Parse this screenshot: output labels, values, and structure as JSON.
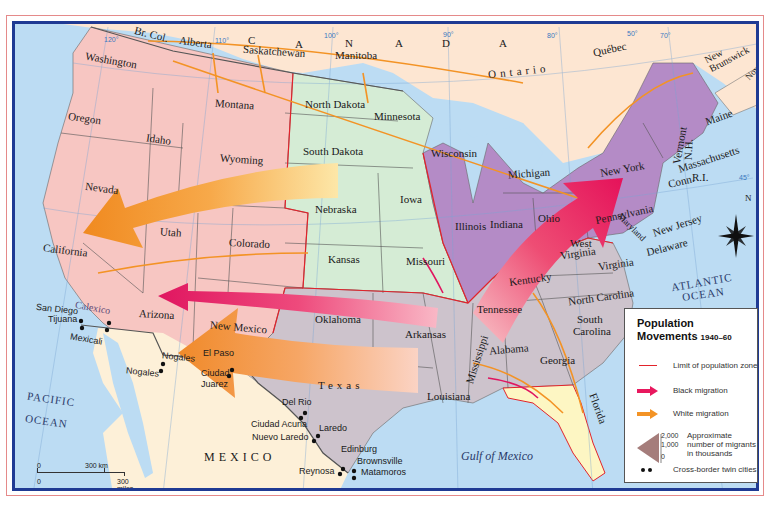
{
  "title": "Population Movements 1940–60",
  "colors": {
    "ocean": "#bcdcf3",
    "canada": "#fde6d2",
    "mexico": "#fdf0d8",
    "west_zone": "#f7c6c2",
    "plains_zone": "#d5ecd5",
    "northeast_midwest_zone": "#b48bc6",
    "south_zone": "#cdc3cc",
    "florida": "#fdf6c3",
    "black_migration": "#e8185e",
    "white_migration": "#f39325",
    "zone_limit": "#e2232b",
    "frame": "#1f3a93"
  },
  "countries": {
    "canada_letters": [
      "C",
      "A",
      "N",
      "A",
      "D",
      "A"
    ],
    "mexico": "MEXICO"
  },
  "provinces": [
    "Br. Col.",
    "Alberta",
    "Saskatchewan",
    "Manitoba",
    "Ontario",
    "Québec",
    "New Brunswick",
    "Nova Scotia"
  ],
  "states": {
    "washington": "Washington",
    "oregon": "Oregon",
    "california": "California",
    "idaho": "Idaho",
    "nevada": "Nevada",
    "montana": "Montana",
    "wyoming": "Wyoming",
    "utah": "Utah",
    "colorado": "Colorado",
    "arizona": "Arizona",
    "new_mexico": "New Mexico",
    "north_dakota": "North Dakota",
    "south_dakota": "South Dakota",
    "nebraska": "Nebraska",
    "kansas": "Kansas",
    "minnesota": "Minnesota",
    "iowa": "Iowa",
    "missouri": "Missouri",
    "oklahoma": "Oklahoma",
    "texas": "Texas",
    "arkansas": "Arkansas",
    "louisiana": "Louisiana",
    "wisconsin": "Wisconsin",
    "michigan": "Michigan",
    "illinois": "Illinois",
    "indiana": "Indiana",
    "ohio": "Ohio",
    "kentucky": "Kentucky",
    "tennessee": "Tennessee",
    "mississippi": "Mississippi",
    "alabama": "Alabama",
    "georgia": "Georgia",
    "florida": "Florida",
    "south_carolina_1": "South",
    "south_carolina_2": "Carolina",
    "north_carolina": "North Carolina",
    "virginia": "Virginia",
    "west_virginia_1": "West",
    "west_virginia_2": "Virginia",
    "maryland": "Maryland",
    "delaware": "Delaware",
    "new_jersey": "New Jersey",
    "pennsylvania": "Pennsylvania",
    "new_york": "New York",
    "connecticut": "Conn.",
    "rhode_island": "R.I.",
    "massachusetts": "Massachusetts",
    "vermont": "Vermont",
    "new_hampshire": "N.H.",
    "maine": "Maine"
  },
  "water": {
    "pacific_1": "PACIFIC",
    "pacific_2": "OCEAN",
    "atlantic_1": "ATLANTIC",
    "atlantic_2": "OCEAN",
    "gulf": "Gulf of Mexico"
  },
  "twin_cities": [
    {
      "us": "San Diego",
      "mx": "Tijuana"
    },
    {
      "us": "Calexico",
      "mx": "Mexicali"
    },
    {
      "us": "Nogales",
      "mx": "Nogales"
    },
    {
      "us": "El Paso",
      "mx": "Ciudad Juarez"
    },
    {
      "us": "Del Rio",
      "mx": "Ciudad Acuna"
    },
    {
      "us": "Laredo",
      "mx": "Nuevo Laredo"
    },
    {
      "us": "Edinburg",
      "mx": "Reynosa"
    },
    {
      "us": "Brownsville",
      "mx": "Matamoros"
    }
  ],
  "city_labels": {
    "san_diego": "San Diego",
    "tijuana": "Tijuana",
    "calexico": "Calexico",
    "mexicali": "Mexicali",
    "nogales_us": "Nogales",
    "nogales_mx": "Nogales",
    "el_paso": "El Paso",
    "ciudad": "Ciudad",
    "juarez": "Juarez",
    "del_rio": "Del Rio",
    "ciudad_acuna": "Ciudad Acuna",
    "laredo": "Laredo",
    "nuevo_laredo": "Nuevo Laredo",
    "edinburg": "Edinburg",
    "reynosa": "Reynosa",
    "brownsville": "Brownsville",
    "matamoros": "Matamoros"
  },
  "graticule": {
    "lon_120": "120°",
    "lon_110": "110°",
    "lon_100": "100°",
    "lon_90": "90°",
    "lon_80": "80°",
    "lon_70": "70°",
    "lat_50": "50°",
    "lat_45": "45°"
  },
  "compass": {
    "north": "N"
  },
  "scale_bar": {
    "zero_km": "0",
    "km": "300 km",
    "zero_mi": "0",
    "miles": "300 miles"
  },
  "legend": {
    "title_line1": "Population",
    "title_line2": "Movements",
    "years": "1940–60",
    "items": [
      {
        "symbol": "red-line",
        "label": "Limit of population zone"
      },
      {
        "symbol": "pink-arrow",
        "label": "Black migration"
      },
      {
        "symbol": "orange-arrow",
        "label": "White migration"
      },
      {
        "symbol": "width-scale",
        "label": "Approximate number of migrants in thousands",
        "ticks": [
          "2,000",
          "1,000",
          "0"
        ]
      },
      {
        "symbol": "twin-dots",
        "label": "Cross-border twin cities"
      }
    ]
  }
}
